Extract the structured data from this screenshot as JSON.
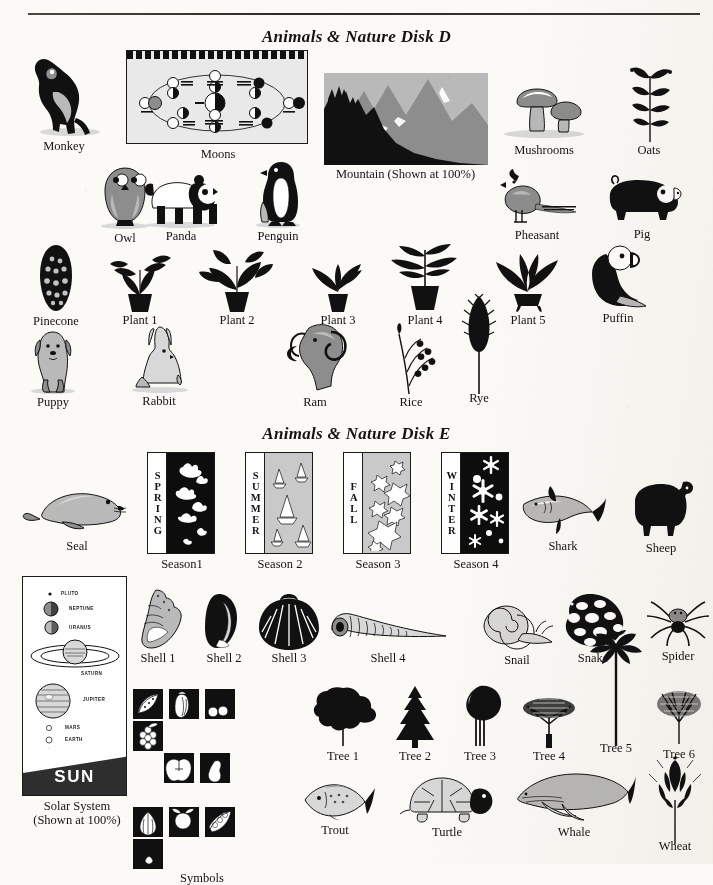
{
  "page": {
    "width": 713,
    "height": 864,
    "background_color": "#fbfaf7",
    "ink_color": "#111111",
    "rule_color": "#2c2a26"
  },
  "sections": [
    {
      "id": "disk-d",
      "title": "Animals & Nature Disk D"
    },
    {
      "id": "disk-e",
      "title": "Animals & Nature Disk E"
    }
  ],
  "disk_d": {
    "row1": [
      {
        "name": "monkey",
        "label": "Monkey"
      },
      {
        "name": "moons",
        "label": "Moons"
      },
      {
        "name": "mountain",
        "label": "Mountain (Shown at 100%)"
      },
      {
        "name": "mushrooms",
        "label": "Mushrooms"
      },
      {
        "name": "oats",
        "label": "Oats"
      }
    ],
    "row2": [
      {
        "name": "owl",
        "label": "Owl"
      },
      {
        "name": "panda",
        "label": "Panda"
      },
      {
        "name": "penguin",
        "label": "Penguin"
      },
      {
        "name": "pheasant",
        "label": "Pheasant"
      },
      {
        "name": "pig",
        "label": "Pig"
      }
    ],
    "row3": [
      {
        "name": "pinecone",
        "label": "Pinecone"
      },
      {
        "name": "plant-1",
        "label": "Plant 1"
      },
      {
        "name": "plant-2",
        "label": "Plant 2"
      },
      {
        "name": "plant-3",
        "label": "Plant 3"
      },
      {
        "name": "plant-4",
        "label": "Plant 4"
      },
      {
        "name": "plant-5",
        "label": "Plant 5"
      },
      {
        "name": "puffin",
        "label": "Puffin"
      }
    ],
    "row4": [
      {
        "name": "puppy",
        "label": "Puppy"
      },
      {
        "name": "rabbit",
        "label": "Rabbit"
      },
      {
        "name": "ram",
        "label": "Ram"
      },
      {
        "name": "rice",
        "label": "Rice"
      },
      {
        "name": "rye",
        "label": "Rye"
      }
    ],
    "moons_panel": {
      "header_text": "PHASES OF THE MOON"
    }
  },
  "disk_e": {
    "row1": [
      {
        "name": "seal",
        "label": "Seal"
      },
      {
        "name": "season-1",
        "label": "Season1",
        "word": "SPRING"
      },
      {
        "name": "season-2",
        "label": "Season 2",
        "word": "SUMMER"
      },
      {
        "name": "season-3",
        "label": "Season 3",
        "word": "FALL"
      },
      {
        "name": "season-4",
        "label": "Season 4",
        "word": "WINTER"
      },
      {
        "name": "shark",
        "label": "Shark"
      },
      {
        "name": "sheep",
        "label": "Sheep"
      }
    ],
    "row2": [
      {
        "name": "shell-1",
        "label": "Shell 1"
      },
      {
        "name": "shell-2",
        "label": "Shell 2"
      },
      {
        "name": "shell-3",
        "label": "Shell 3"
      },
      {
        "name": "shell-4",
        "label": "Shell 4"
      },
      {
        "name": "snail",
        "label": "Snail"
      },
      {
        "name": "snake",
        "label": "Snake"
      },
      {
        "name": "spider",
        "label": "Spider"
      }
    ],
    "row3": [
      {
        "name": "tree-1",
        "label": "Tree 1"
      },
      {
        "name": "tree-2",
        "label": "Tree 2"
      },
      {
        "name": "tree-3",
        "label": "Tree 3"
      },
      {
        "name": "tree-4",
        "label": "Tree 4"
      },
      {
        "name": "tree-5",
        "label": "Tree 5"
      },
      {
        "name": "tree-6",
        "label": "Tree 6"
      }
    ],
    "row4": [
      {
        "name": "symbols",
        "label": "Symbols"
      },
      {
        "name": "trout",
        "label": "Trout"
      },
      {
        "name": "turtle",
        "label": "Turtle"
      },
      {
        "name": "whale",
        "label": "Whale"
      },
      {
        "name": "wheat",
        "label": "Wheat"
      }
    ],
    "solar_system": {
      "label_line1": "Solar System",
      "label_line2": "(Shown at 100%)",
      "sun_word": "SUN",
      "planets": [
        "PLUTO",
        "NEPTUNE",
        "URANUS",
        "SATURN",
        "JUPITER",
        "MARS",
        "EARTH",
        "VENUS",
        "MERCURY"
      ]
    },
    "symbols_tiles": [
      "watermelon",
      "pepper",
      "cherries",
      "grapes",
      "apple",
      "pear",
      "garlic",
      "radish",
      "peas",
      "scallions"
    ]
  }
}
